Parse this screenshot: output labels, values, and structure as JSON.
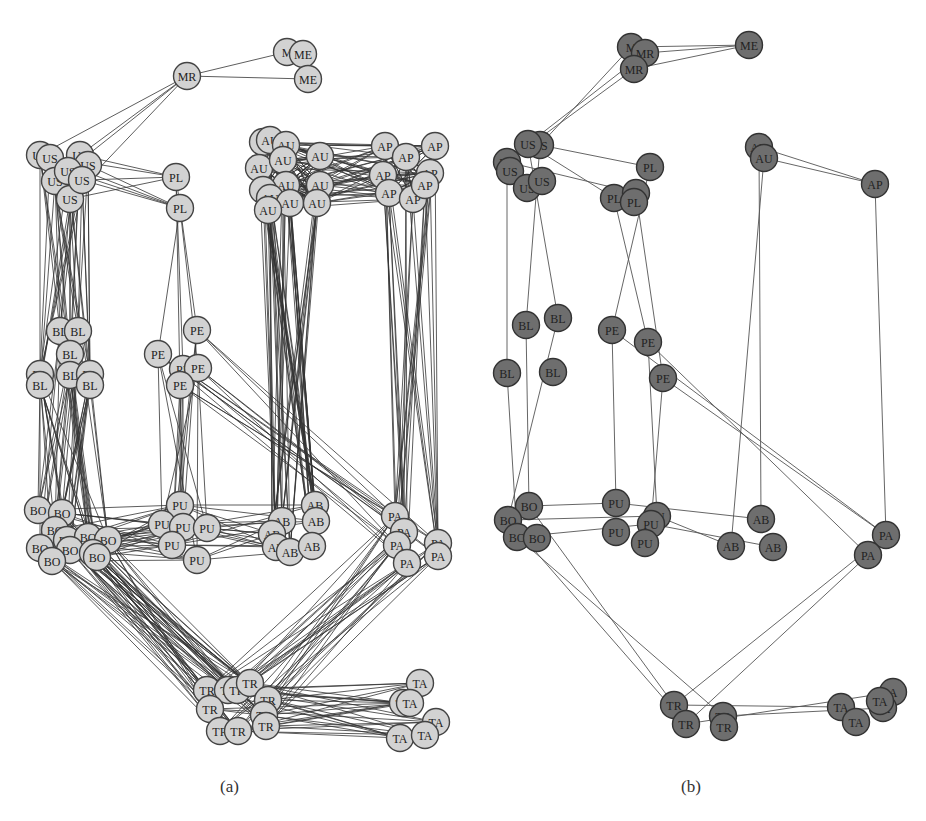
{
  "figure": {
    "panels": [
      {
        "caption": "(a)",
        "node_fill": "#d2d2d2",
        "node_stroke": "#444444",
        "edge_color": "#333333",
        "nodes": [
          {
            "id": "MR1",
            "label": "MR",
            "x": 187,
            "y": 76
          },
          {
            "id": "ME1",
            "label": "M",
            "x": 287,
            "y": 52
          },
          {
            "id": "ME2",
            "label": "ME",
            "x": 303,
            "y": 54
          },
          {
            "id": "ME3",
            "label": "ME",
            "x": 308,
            "y": 79
          },
          {
            "id": "US1",
            "label": "US",
            "x": 40,
            "y": 155
          },
          {
            "id": "US2",
            "label": "US",
            "x": 50,
            "y": 158
          },
          {
            "id": "US3",
            "label": "US",
            "x": 80,
            "y": 155
          },
          {
            "id": "US4",
            "label": "US",
            "x": 88,
            "y": 165
          },
          {
            "id": "US5",
            "label": "US",
            "x": 55,
            "y": 181
          },
          {
            "id": "US6",
            "label": "US",
            "x": 68,
            "y": 171
          },
          {
            "id": "US7",
            "label": "US",
            "x": 70,
            "y": 199
          },
          {
            "id": "US8",
            "label": "US",
            "x": 82,
            "y": 180
          },
          {
            "id": "PL1",
            "label": "PL",
            "x": 176,
            "y": 177
          },
          {
            "id": "PL2",
            "label": "PL",
            "x": 180,
            "y": 208
          },
          {
            "id": "AU1",
            "label": "A",
            "x": 263,
            "y": 142
          },
          {
            "id": "AU2",
            "label": "AU",
            "x": 270,
            "y": 140
          },
          {
            "id": "AU3",
            "label": "AU",
            "x": 286,
            "y": 145
          },
          {
            "id": "AU4",
            "label": "AU",
            "x": 320,
            "y": 156
          },
          {
            "id": "AU5",
            "label": "AU",
            "x": 259,
            "y": 168
          },
          {
            "id": "AU6",
            "label": "AU",
            "x": 283,
            "y": 160
          },
          {
            "id": "AU7",
            "label": "AU",
            "x": 286,
            "y": 185
          },
          {
            "id": "AU8",
            "label": "AU",
            "x": 320,
            "y": 185
          },
          {
            "id": "AU9",
            "label": "A",
            "x": 263,
            "y": 190
          },
          {
            "id": "AU10",
            "label": "AU",
            "x": 270,
            "y": 198
          },
          {
            "id": "AU11",
            "label": "AU",
            "x": 290,
            "y": 203
          },
          {
            "id": "AU12",
            "label": "AU",
            "x": 317,
            "y": 203
          },
          {
            "id": "AU13",
            "label": "AU",
            "x": 268,
            "y": 210
          },
          {
            "id": "AP1",
            "label": "AP",
            "x": 385,
            "y": 146
          },
          {
            "id": "AP2",
            "label": "AP",
            "x": 406,
            "y": 157
          },
          {
            "id": "AP3",
            "label": "AP",
            "x": 435,
            "y": 146
          },
          {
            "id": "AP4",
            "label": "AP",
            "x": 383,
            "y": 175
          },
          {
            "id": "AP5",
            "label": "AP",
            "x": 430,
            "y": 173
          },
          {
            "id": "AP6",
            "label": "AP",
            "x": 389,
            "y": 193
          },
          {
            "id": "AP7",
            "label": "AP",
            "x": 413,
            "y": 199
          },
          {
            "id": "AP8",
            "label": "AP",
            "x": 425,
            "y": 185
          },
          {
            "id": "BL1",
            "label": "BL",
            "x": 60,
            "y": 331
          },
          {
            "id": "BL2",
            "label": "BL",
            "x": 78,
            "y": 331
          },
          {
            "id": "BL3",
            "label": "BL",
            "x": 70,
            "y": 354
          },
          {
            "id": "BL4",
            "label": "BL",
            "x": 40,
            "y": 374
          },
          {
            "id": "BL5",
            "label": "BL",
            "x": 70,
            "y": 375
          },
          {
            "id": "BL6",
            "label": "BL",
            "x": 90,
            "y": 374
          },
          {
            "id": "BL7",
            "label": "BL",
            "x": 40,
            "y": 385
          },
          {
            "id": "BL8",
            "label": "BL",
            "x": 90,
            "y": 385
          },
          {
            "id": "PE1",
            "label": "PE",
            "x": 197,
            "y": 330
          },
          {
            "id": "PE2",
            "label": "PE",
            "x": 158,
            "y": 354
          },
          {
            "id": "PE3",
            "label": "PE",
            "x": 183,
            "y": 369
          },
          {
            "id": "PE4",
            "label": "PE",
            "x": 198,
            "y": 368
          },
          {
            "id": "PE5",
            "label": "PE",
            "x": 180,
            "y": 385
          },
          {
            "id": "BO1",
            "label": "BO",
            "x": 38,
            "y": 510
          },
          {
            "id": "BO2",
            "label": "BO",
            "x": 62,
            "y": 513
          },
          {
            "id": "BO3",
            "label": "BO",
            "x": 55,
            "y": 530
          },
          {
            "id": "BO4",
            "label": "BO",
            "x": 67,
            "y": 540
          },
          {
            "id": "BO5",
            "label": "BO",
            "x": 88,
            "y": 537
          },
          {
            "id": "BO6",
            "label": "BO",
            "x": 108,
            "y": 540
          },
          {
            "id": "BO7",
            "label": "BO",
            "x": 40,
            "y": 548
          },
          {
            "id": "BO8",
            "label": "BO",
            "x": 70,
            "y": 550
          },
          {
            "id": "BO9",
            "label": "BO",
            "x": 93,
            "y": 553
          },
          {
            "id": "BO10",
            "label": "BO",
            "x": 52,
            "y": 561
          },
          {
            "id": "BO11",
            "label": "BO",
            "x": 97,
            "y": 557
          },
          {
            "id": "PU1",
            "label": "PU",
            "x": 180,
            "y": 505
          },
          {
            "id": "PU2",
            "label": "PU",
            "x": 162,
            "y": 524
          },
          {
            "id": "PU3",
            "label": "PU",
            "x": 183,
            "y": 527
          },
          {
            "id": "PU4",
            "label": "PU",
            "x": 207,
            "y": 528
          },
          {
            "id": "PU5",
            "label": "PU",
            "x": 172,
            "y": 545
          },
          {
            "id": "PU6",
            "label": "PU",
            "x": 197,
            "y": 560
          },
          {
            "id": "AB1",
            "label": "AB",
            "x": 315,
            "y": 505
          },
          {
            "id": "AB2",
            "label": "AB",
            "x": 282,
            "y": 521
          },
          {
            "id": "AB3",
            "label": "AB",
            "x": 316,
            "y": 521
          },
          {
            "id": "AB4",
            "label": "AB",
            "x": 272,
            "y": 534
          },
          {
            "id": "AB5",
            "label": "AB",
            "x": 276,
            "y": 547
          },
          {
            "id": "AB6",
            "label": "AB",
            "x": 290,
            "y": 552
          },
          {
            "id": "AB7",
            "label": "AB",
            "x": 312,
            "y": 546
          },
          {
            "id": "PA1",
            "label": "PA",
            "x": 395,
            "y": 516
          },
          {
            "id": "PA2",
            "label": "PA",
            "x": 404,
            "y": 532
          },
          {
            "id": "PA3",
            "label": "PA",
            "x": 397,
            "y": 545
          },
          {
            "id": "PA4",
            "label": "PA",
            "x": 407,
            "y": 563
          },
          {
            "id": "PA5",
            "label": "PA",
            "x": 438,
            "y": 543
          },
          {
            "id": "PA6",
            "label": "PA",
            "x": 438,
            "y": 556
          },
          {
            "id": "TR1",
            "label": "TR",
            "x": 207,
            "y": 690
          },
          {
            "id": "TR2",
            "label": "TR",
            "x": 228,
            "y": 690
          },
          {
            "id": "TR3",
            "label": "TR",
            "x": 237,
            "y": 690
          },
          {
            "id": "TR4",
            "label": "TR",
            "x": 250,
            "y": 683
          },
          {
            "id": "TR5",
            "label": "TR",
            "x": 268,
            "y": 700
          },
          {
            "id": "TR6",
            "label": "TR",
            "x": 210,
            "y": 709
          },
          {
            "id": "TR7",
            "label": "TR",
            "x": 264,
            "y": 715
          },
          {
            "id": "TR8",
            "label": "TR",
            "x": 220,
            "y": 731
          },
          {
            "id": "TR9",
            "label": "TR",
            "x": 238,
            "y": 731
          },
          {
            "id": "TR10",
            "label": "TR",
            "x": 266,
            "y": 726
          },
          {
            "id": "TA1",
            "label": "TA",
            "x": 420,
            "y": 683
          },
          {
            "id": "TA2",
            "label": "TA",
            "x": 403,
            "y": 703
          },
          {
            "id": "TA3",
            "label": "TA",
            "x": 410,
            "y": 703
          },
          {
            "id": "TA4",
            "label": "TA",
            "x": 436,
            "y": 722
          },
          {
            "id": "TA5",
            "label": "TA",
            "x": 400,
            "y": 738
          },
          {
            "id": "TA6",
            "label": "TA",
            "x": 425,
            "y": 735
          }
        ]
      },
      {
        "caption": "(b)",
        "node_fill": "#6e6e6e",
        "node_stroke": "#333333",
        "edge_color": "#555555",
        "nodes": [
          {
            "id": "MR1",
            "label": "M",
            "x": 631,
            "y": 47
          },
          {
            "id": "MR2",
            "label": "MR",
            "x": 645,
            "y": 53
          },
          {
            "id": "MR3",
            "label": "MR",
            "x": 634,
            "y": 69
          },
          {
            "id": "ME1",
            "label": "ME",
            "x": 749,
            "y": 45
          },
          {
            "id": "US1",
            "label": "US",
            "x": 540,
            "y": 145
          },
          {
            "id": "US2",
            "label": "US",
            "x": 528,
            "y": 144
          },
          {
            "id": "US3",
            "label": "US",
            "x": 507,
            "y": 162
          },
          {
            "id": "US4",
            "label": "US",
            "x": 510,
            "y": 171
          },
          {
            "id": "US5",
            "label": "US",
            "x": 527,
            "y": 188
          },
          {
            "id": "US6",
            "label": "US",
            "x": 542,
            "y": 181
          },
          {
            "id": "PL1",
            "label": "PL",
            "x": 650,
            "y": 167
          },
          {
            "id": "PL2",
            "label": "PL",
            "x": 614,
            "y": 198
          },
          {
            "id": "PL3",
            "label": "PL",
            "x": 636,
            "y": 193
          },
          {
            "id": "PL4",
            "label": "PL",
            "x": 634,
            "y": 202
          },
          {
            "id": "AU1",
            "label": "AU",
            "x": 759,
            "y": 147
          },
          {
            "id": "AU2",
            "label": "AU",
            "x": 764,
            "y": 158
          },
          {
            "id": "AP1",
            "label": "AP",
            "x": 875,
            "y": 184
          },
          {
            "id": "BL1",
            "label": "BL",
            "x": 526,
            "y": 325
          },
          {
            "id": "BL2",
            "label": "BL",
            "x": 558,
            "y": 318
          },
          {
            "id": "BL3",
            "label": "BL",
            "x": 507,
            "y": 373
          },
          {
            "id": "BL4",
            "label": "BL",
            "x": 553,
            "y": 372
          },
          {
            "id": "PE1",
            "label": "PE",
            "x": 612,
            "y": 330
          },
          {
            "id": "PE2",
            "label": "PE",
            "x": 648,
            "y": 342
          },
          {
            "id": "PE3",
            "label": "PE",
            "x": 663,
            "y": 378
          },
          {
            "id": "BO1",
            "label": "BO",
            "x": 529,
            "y": 506
          },
          {
            "id": "BO2",
            "label": "BO",
            "x": 508,
            "y": 520
          },
          {
            "id": "BO3",
            "label": "BO",
            "x": 517,
            "y": 537
          },
          {
            "id": "BO4",
            "label": "BO",
            "x": 537,
            "y": 538
          },
          {
            "id": "PU1",
            "label": "PU",
            "x": 616,
            "y": 503
          },
          {
            "id": "PU2",
            "label": "PU",
            "x": 657,
            "y": 516
          },
          {
            "id": "PU3",
            "label": "PU",
            "x": 651,
            "y": 524
          },
          {
            "id": "PU4",
            "label": "PU",
            "x": 616,
            "y": 532
          },
          {
            "id": "PU5",
            "label": "PU",
            "x": 645,
            "y": 543
          },
          {
            "id": "AB1",
            "label": "AB",
            "x": 761,
            "y": 519
          },
          {
            "id": "AB2",
            "label": "AB",
            "x": 731,
            "y": 546
          },
          {
            "id": "AB3",
            "label": "AB",
            "x": 773,
            "y": 547
          },
          {
            "id": "PA1",
            "label": "PA",
            "x": 886,
            "y": 535
          },
          {
            "id": "PA2",
            "label": "PA",
            "x": 868,
            "y": 555
          },
          {
            "id": "TR1",
            "label": "TR",
            "x": 674,
            "y": 705
          },
          {
            "id": "TR2",
            "label": "TR",
            "x": 686,
            "y": 724
          },
          {
            "id": "TR3",
            "label": "TR",
            "x": 723,
            "y": 716
          },
          {
            "id": "TR4",
            "label": "TR",
            "x": 724,
            "y": 727
          },
          {
            "id": "TA1",
            "label": "TA",
            "x": 841,
            "y": 707
          },
          {
            "id": "TA2",
            "label": "A",
            "x": 893,
            "y": 692
          },
          {
            "id": "TA3",
            "label": "TA",
            "x": 883,
            "y": 708
          },
          {
            "id": "TA4",
            "label": "TA",
            "x": 856,
            "y": 722
          },
          {
            "id": "TA5",
            "label": "TA",
            "x": 880,
            "y": 701
          }
        ]
      }
    ]
  }
}
